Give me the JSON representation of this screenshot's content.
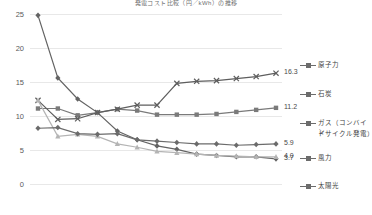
{
  "chart_data": {
    "type": "line",
    "title": "発電コスト比較（円／kWh）の推移",
    "xlabel": "",
    "ylabel": "",
    "ylim": [
      0,
      25
    ],
    "yticks": [
      0,
      5,
      10,
      15,
      20,
      25
    ],
    "grid": true,
    "legend_position": "right",
    "x": [
      1,
      2,
      3,
      4,
      5,
      6,
      7,
      8,
      9,
      10,
      11,
      12,
      13
    ],
    "series": [
      {
        "name": "原子力",
        "color": "#636363",
        "marker": "diamond",
        "values": [
          24.8,
          15.6,
          12.5,
          10.5,
          7.8,
          6.5,
          5.6,
          5.1,
          4.4,
          4.2,
          4.0,
          4.0,
          3.7
        ],
        "end_label": "3.7"
      },
      {
        "name": "石炭",
        "color": "#7a7a7a",
        "marker": "square",
        "values": [
          11.1,
          11.1,
          10.1,
          10.5,
          11.0,
          10.8,
          10.2,
          10.2,
          10.2,
          10.3,
          10.6,
          10.9,
          11.2
        ],
        "end_label": "11.2"
      },
      {
        "name": "ガス（コンバインドサイクル発電）",
        "color": "#5e5e5e",
        "marker": "cross",
        "values": [
          12.3,
          9.5,
          9.6,
          10.5,
          11.0,
          11.6,
          11.6,
          14.8,
          15.1,
          15.2,
          15.5,
          15.8,
          16.3
        ],
        "end_label": "16.3"
      },
      {
        "name": "風力",
        "color": "#b4b4b4",
        "marker": "triangle",
        "values": [
          12.3,
          7.0,
          7.3,
          7.0,
          5.9,
          5.4,
          4.8,
          4.6,
          4.4,
          4.2,
          4.1,
          4.0,
          4.0
        ],
        "end_label": "4.0"
      },
      {
        "name": "太陽光",
        "color": "#6b6b6b",
        "marker": "diamond",
        "values": [
          8.2,
          8.3,
          7.4,
          7.3,
          7.4,
          6.5,
          6.3,
          6.1,
          5.9,
          5.9,
          5.7,
          5.8,
          5.9
        ],
        "end_label": "5.9"
      }
    ]
  },
  "legend": {
    "items": [
      {
        "label": "原子力"
      },
      {
        "label": "石炭"
      },
      {
        "label": "ガス（コンバイン"
      },
      {
        "label": "ドサイクル発電）"
      },
      {
        "label": "風力"
      },
      {
        "label": "太陽光"
      }
    ]
  },
  "value_labels": {
    "coal_end": "16.3",
    "gas_end": "11.2",
    "solar_end": "5.9",
    "wind_end": "4.0",
    "nuclear_end": "3.7"
  },
  "axis": {
    "y_labels": [
      "25",
      "20",
      "15",
      "10",
      "5",
      "0"
    ]
  }
}
